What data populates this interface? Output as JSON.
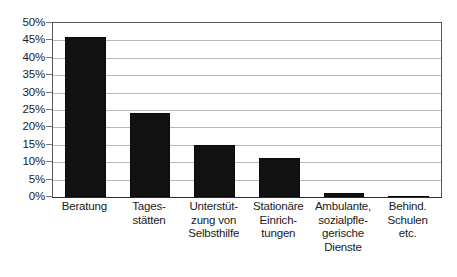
{
  "chart_data": {
    "type": "bar",
    "title": "",
    "subtitle": "",
    "xlabel": "",
    "ylabel": "",
    "ylim": [
      0,
      50
    ],
    "ytick_step": 5,
    "ytick_labels": [
      "0%",
      "5%",
      "10%",
      "15%",
      "20%",
      "25%",
      "30%",
      "35%",
      "40%",
      "45%",
      "50%"
    ],
    "ytick_values": [
      0,
      5,
      10,
      15,
      20,
      25,
      30,
      35,
      40,
      45,
      50
    ],
    "grid": true,
    "grid_axis": "y",
    "legend": false,
    "legend_position": "none",
    "categories": [
      "Beratung",
      "Tages-\nstätten",
      "Unterstüt-\nzung von\nSelbsthilfe",
      "Stationäre\nEinrich-\ntungen",
      "Ambulante,\nsozialpfle-\ngerische\nDienste",
      "Behind.\nSchulen\netc."
    ],
    "values": [
      46,
      24,
      15,
      11.3,
      1.2,
      0.4
    ],
    "value_unit": "%",
    "bar_color": "#121212",
    "plot_background": "#ffffff",
    "grid_color": "#b9b9b9",
    "axis_color": "#555555"
  }
}
